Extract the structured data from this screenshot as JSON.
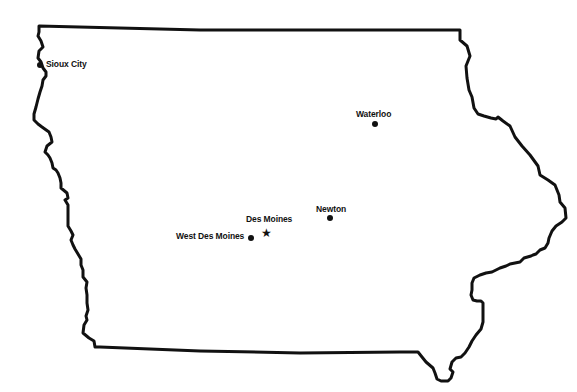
{
  "map": {
    "region": "Iowa",
    "outline_color": "#111111",
    "background": "#ffffff",
    "cities": [
      {
        "name": "Sioux City",
        "marker": "dot",
        "x": 40,
        "y": 65
      },
      {
        "name": "Waterloo",
        "marker": "dot",
        "x": 375,
        "y": 124
      },
      {
        "name": "Newton",
        "marker": "dot",
        "x": 330,
        "y": 218
      },
      {
        "name": "Des Moines",
        "marker": "star",
        "x": 266,
        "y": 233
      },
      {
        "name": "West Des Moines",
        "marker": "dot",
        "x": 251,
        "y": 238
      }
    ]
  },
  "labels": {
    "sioux_city": "Sioux City",
    "waterloo": "Waterloo",
    "newton": "Newton",
    "des_moines": "Des Moines",
    "west_des_moines": "West Des Moines"
  },
  "icons": {
    "city_marker": "●",
    "capital_marker": "★"
  }
}
